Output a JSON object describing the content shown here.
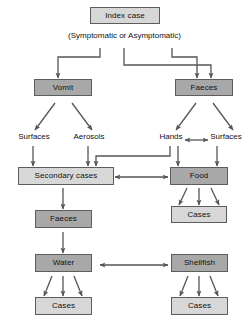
{
  "diagram": {
    "title_box": {
      "label": "Index case"
    },
    "caption": {
      "text": "(Symptomatic or Asymptomatic)"
    },
    "colors": {
      "node_fill_dark": "#a8a8a8",
      "node_fill_light": "#d7d7d7",
      "node_border": "#5d5d5d",
      "edge": "#555555",
      "background": "#ffffff",
      "text": "#111111"
    },
    "nodes": [
      {
        "id": "index-case",
        "label": "Index case",
        "shade": "light"
      },
      {
        "id": "vomit",
        "label": "Vomit",
        "shade": "dark"
      },
      {
        "id": "faeces-top",
        "label": "Faeces",
        "shade": "dark"
      },
      {
        "id": "secondary-cases",
        "label": "Secondary cases",
        "shade": "light"
      },
      {
        "id": "food",
        "label": "Food",
        "shade": "dark"
      },
      {
        "id": "cases-food",
        "label": "Cases",
        "shade": "light"
      },
      {
        "id": "faeces-lower",
        "label": "Faeces",
        "shade": "dark"
      },
      {
        "id": "water",
        "label": "Water",
        "shade": "dark"
      },
      {
        "id": "shellfish",
        "label": "Shellfish",
        "shade": "dark"
      },
      {
        "id": "cases-water",
        "label": "Cases",
        "shade": "light"
      },
      {
        "id": "cases-shellfish",
        "label": "Cases",
        "shade": "light"
      }
    ],
    "plain_labels": [
      {
        "id": "surfaces-left",
        "text": "Surfaces"
      },
      {
        "id": "aerosols",
        "text": "Aerosols"
      },
      {
        "id": "hands",
        "text": "Hands"
      },
      {
        "id": "surfaces-right",
        "text": "Surfaces"
      }
    ],
    "edges": [
      {
        "from": "index-case",
        "to": "vomit",
        "type": "elbow",
        "arrow": "single"
      },
      {
        "from": "index-case",
        "to": "faeces-top",
        "type": "elbow",
        "arrow": "single"
      },
      {
        "from": "index-case",
        "to": "faeces-top",
        "type": "elbow-long",
        "arrow": "single"
      },
      {
        "from": "vomit",
        "to": "surfaces-left",
        "type": "diagonal",
        "arrow": "single"
      },
      {
        "from": "vomit",
        "to": "aerosols",
        "type": "diagonal",
        "arrow": "single"
      },
      {
        "from": "faeces-top",
        "to": "hands",
        "type": "diagonal",
        "arrow": "single"
      },
      {
        "from": "faeces-top",
        "to": "surfaces-right",
        "type": "diagonal",
        "arrow": "single"
      },
      {
        "from": "hands",
        "to": "surfaces-right",
        "type": "straight",
        "arrow": "double"
      },
      {
        "from": "surfaces-left",
        "to": "secondary-cases",
        "type": "straight",
        "arrow": "single"
      },
      {
        "from": "aerosols",
        "to": "secondary-cases",
        "type": "straight",
        "arrow": "single"
      },
      {
        "from": "hands",
        "to": "secondary-cases",
        "type": "elbow",
        "arrow": "single"
      },
      {
        "from": "hands",
        "to": "food",
        "type": "straight",
        "arrow": "single"
      },
      {
        "from": "surfaces-right",
        "to": "food",
        "type": "straight",
        "arrow": "single"
      },
      {
        "from": "secondary-cases",
        "to": "food",
        "type": "straight",
        "arrow": "double"
      },
      {
        "from": "food",
        "to": "cases-food",
        "type": "fan3",
        "arrow": "single"
      },
      {
        "from": "secondary-cases",
        "to": "faeces-lower",
        "type": "straight",
        "arrow": "single"
      },
      {
        "from": "faeces-lower",
        "to": "water",
        "type": "straight",
        "arrow": "single"
      },
      {
        "from": "water",
        "to": "shellfish",
        "type": "straight",
        "arrow": "double"
      },
      {
        "from": "water",
        "to": "cases-water",
        "type": "fan3",
        "arrow": "single"
      },
      {
        "from": "shellfish",
        "to": "cases-shellfish",
        "type": "fan3",
        "arrow": "single"
      }
    ]
  }
}
